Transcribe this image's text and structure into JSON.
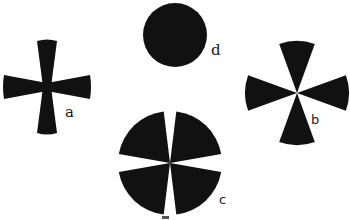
{
  "figure": {
    "background": "#ffffff",
    "ink": "#111111",
    "shapes": [
      {
        "id": "a",
        "label": "a",
        "kind": "cross-flared-arms",
        "center": [
          47,
          87
        ],
        "radius": 44,
        "inner_half_width": 4,
        "outer_half_width": 10,
        "label_pos": [
          65,
          117
        ]
      },
      {
        "id": "d",
        "label": "d",
        "kind": "filled-circle",
        "center": [
          175,
          35
        ],
        "radius": 32,
        "label_pos": [
          211,
          55
        ]
      },
      {
        "id": "b",
        "label": "b",
        "kind": "four-narrow-sectors",
        "center": [
          297,
          93
        ],
        "radius": 52,
        "sector_half_angle_deg": 20,
        "label_pos": [
          311,
          124
        ]
      },
      {
        "id": "c",
        "label": "c",
        "kind": "four-wide-sectors",
        "center": [
          170,
          163
        ],
        "radius": 52,
        "sector_half_angle_deg": 38,
        "label_pos": [
          219,
          204
        ]
      }
    ]
  }
}
